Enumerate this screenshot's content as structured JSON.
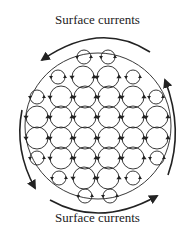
{
  "labels": {
    "top": "Surface currents",
    "bottom": "Surface currents"
  },
  "colors": {
    "stroke": "#222222",
    "background": "#ffffff"
  },
  "diagram": {
    "boundary": {
      "cx": 98,
      "cy": 126,
      "r": 73
    },
    "cells": [
      {
        "x": 84,
        "y": 57,
        "r": 7
      },
      {
        "x": 108,
        "y": 57,
        "r": 7
      },
      {
        "x": 58,
        "y": 77,
        "r": 7
      },
      {
        "x": 83,
        "y": 77,
        "r": 11
      },
      {
        "x": 108,
        "y": 77,
        "r": 11
      },
      {
        "x": 133,
        "y": 77,
        "r": 7
      },
      {
        "x": 37,
        "y": 97,
        "r": 7
      },
      {
        "x": 61,
        "y": 97,
        "r": 11
      },
      {
        "x": 85,
        "y": 97,
        "r": 11
      },
      {
        "x": 109,
        "y": 97,
        "r": 11
      },
      {
        "x": 133,
        "y": 97,
        "r": 11
      },
      {
        "x": 156,
        "y": 97,
        "r": 7
      },
      {
        "x": 37,
        "y": 117,
        "r": 11
      },
      {
        "x": 61,
        "y": 117,
        "r": 11
      },
      {
        "x": 85,
        "y": 117,
        "r": 11
      },
      {
        "x": 109,
        "y": 117,
        "r": 11
      },
      {
        "x": 133,
        "y": 117,
        "r": 11
      },
      {
        "x": 157,
        "y": 117,
        "r": 11
      },
      {
        "x": 37,
        "y": 138,
        "r": 11
      },
      {
        "x": 61,
        "y": 138,
        "r": 11
      },
      {
        "x": 85,
        "y": 138,
        "r": 11
      },
      {
        "x": 109,
        "y": 138,
        "r": 11
      },
      {
        "x": 133,
        "y": 138,
        "r": 11
      },
      {
        "x": 157,
        "y": 138,
        "r": 11
      },
      {
        "x": 37,
        "y": 158,
        "r": 7
      },
      {
        "x": 61,
        "y": 158,
        "r": 11
      },
      {
        "x": 85,
        "y": 158,
        "r": 11
      },
      {
        "x": 109,
        "y": 158,
        "r": 11
      },
      {
        "x": 133,
        "y": 158,
        "r": 11
      },
      {
        "x": 157,
        "y": 158,
        "r": 7
      },
      {
        "x": 59,
        "y": 178,
        "r": 7
      },
      {
        "x": 84,
        "y": 178,
        "r": 11
      },
      {
        "x": 108,
        "y": 178,
        "r": 11
      },
      {
        "x": 133,
        "y": 178,
        "r": 7
      },
      {
        "x": 85,
        "y": 196,
        "r": 7
      },
      {
        "x": 110,
        "y": 196,
        "r": 7
      }
    ]
  }
}
